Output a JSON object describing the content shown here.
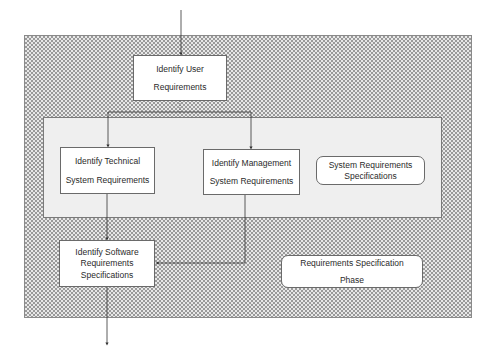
{
  "diagram": {
    "phase_label": {
      "line1": "Requirements Specification",
      "line2": "Phase"
    },
    "nodes": {
      "user_requirements": {
        "line1": "Identify  User",
        "line2": "Requirements"
      },
      "technical_requirements": {
        "line1": "Identify Technical",
        "line2": "System Requirements"
      },
      "management_requirements": {
        "line1": "Identify Management",
        "line2": "System Requirements"
      },
      "system_requirements_spec": {
        "line1": "System Requirements",
        "line2": "Specifications"
      },
      "software_requirements_spec": {
        "line1": "Identify Software",
        "line2": "Requirements",
        "line3": "Specifications"
      }
    },
    "colors": {
      "hatch": "#9a9a9a",
      "panel": "#efefef",
      "box_border": "#6a6a6a",
      "line": "#333333"
    }
  }
}
